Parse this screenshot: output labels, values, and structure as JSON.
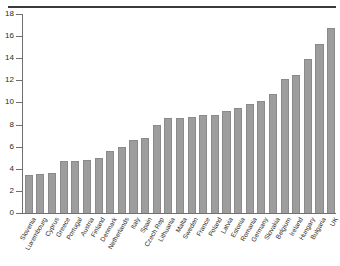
{
  "figure": {
    "has_top_rule": true,
    "bar_color": "#9d9d9d",
    "axis_color": "#6f6f6f",
    "text_color": "#2b2b2b",
    "background": "#ffffff"
  },
  "chart_data": {
    "type": "bar",
    "title": "",
    "subtitle": "",
    "xlabel": "",
    "ylabel": "",
    "ylim": [
      0,
      18
    ],
    "ytick_values": [
      0,
      2,
      4,
      6,
      8,
      10,
      12,
      14,
      16,
      18
    ],
    "ytick_labels": [
      "0",
      "2",
      "4",
      "6",
      "8",
      "10",
      "12",
      "14",
      "16",
      "18"
    ],
    "grid": false,
    "legend": null,
    "orientation": "vertical",
    "sorted": "ascending",
    "categories": [
      "Slovenia",
      "Luxembourg",
      "Cyprus",
      "Greece",
      "Portugal",
      "Austria",
      "Finland",
      "Denmark",
      "Netherlands",
      "Italy",
      "Spain",
      "Czech Rep",
      "Lithuania",
      "Malta",
      "Sweden",
      "France",
      "Poland",
      "Latvia",
      "Estonia",
      "Romania",
      "Germany",
      "Slovakia",
      "Belgium",
      "Ireland",
      "Hungary",
      "Bulgaria",
      "UK"
    ],
    "values": [
      3.4,
      3.5,
      3.65,
      4.7,
      4.75,
      4.8,
      5.0,
      5.6,
      5.95,
      6.6,
      6.75,
      7.95,
      8.6,
      8.6,
      8.65,
      8.9,
      8.9,
      9.25,
      9.5,
      9.85,
      10.1,
      10.8,
      12.15,
      12.45,
      13.95,
      15.3,
      16.7
    ]
  }
}
